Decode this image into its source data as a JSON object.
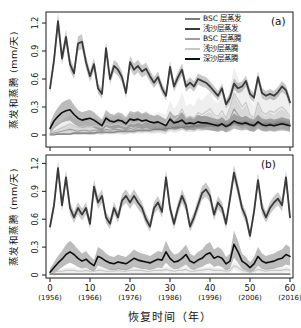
{
  "figure": {
    "background": "#ffffff",
    "frame_color": "#1a1a1a"
  },
  "axes": {
    "ylabel": "蒸发和蒸腾 (mm/天)",
    "xlabel": "恢复时间（年）",
    "y_ticks": [
      "0",
      "0.3",
      "0.6",
      "0.9",
      "1.2"
    ],
    "y_tick_values": [
      0,
      0.3,
      0.6,
      0.9,
      1.2
    ],
    "x_ticks": [
      "0",
      "10",
      "20",
      "30",
      "40",
      "50",
      "60"
    ],
    "x_tick_values": [
      0,
      10,
      20,
      30,
      40,
      50,
      60
    ],
    "x_tick_years": [
      "(1956)",
      "(1966)",
      "(1976)",
      "(1986)",
      "(1996)",
      "(2006)",
      "(2016)"
    ]
  },
  "chart_data": [
    {
      "type": "line",
      "panel_label": "(a)",
      "xlabel": "恢复时间（年）",
      "ylabel": "蒸发和蒸腾 (mm/天)",
      "x_range": [
        0,
        60
      ],
      "y_range": [
        0,
        1.2
      ],
      "grid": false,
      "legend_position": "top-right-inside",
      "x": [
        0,
        1,
        2,
        3,
        4,
        5,
        6,
        7,
        8,
        9,
        10,
        11,
        12,
        13,
        14,
        15,
        16,
        17,
        18,
        19,
        20,
        21,
        22,
        23,
        24,
        25,
        26,
        27,
        28,
        29,
        30,
        31,
        32,
        33,
        34,
        35,
        36,
        37,
        38,
        39,
        40,
        41,
        42,
        43,
        44,
        45,
        46,
        47,
        48,
        49,
        50,
        51,
        52,
        53,
        54,
        55,
        56,
        57,
        58,
        59,
        60
      ],
      "series": [
        {
          "name": "BSC 层蒸发",
          "color": "#7d7d7d",
          "band_abs": 0.012,
          "band_rel": 0.1,
          "values": [
            0.0,
            0.0,
            0.01,
            0.01,
            0.01,
            0.01,
            0.02,
            0.02,
            0.02,
            0.02,
            0.02,
            0.02,
            0.03,
            0.03,
            0.03,
            0.03,
            0.03,
            0.04,
            0.04,
            0.04,
            0.04,
            0.04,
            0.05,
            0.05,
            0.05,
            0.05,
            0.06,
            0.06,
            0.06,
            0.07,
            0.07,
            0.08,
            0.08,
            0.08,
            0.09,
            0.09,
            0.1,
            0.1,
            0.1,
            0.11,
            0.11,
            0.11,
            0.11,
            0.12,
            0.11,
            0.12,
            0.13,
            0.12,
            0.12,
            0.13,
            0.12,
            0.11,
            0.13,
            0.12,
            0.12,
            0.12,
            0.12,
            0.13,
            0.13,
            0.13,
            0.12
          ]
        },
        {
          "name": "浅沙层蒸发",
          "color": "#3a3a3a",
          "band_abs": 0.03,
          "band_rel": 0.05,
          "values": [
            0.5,
            0.8,
            1.22,
            0.82,
            1.05,
            0.76,
            0.66,
            0.98,
            1.0,
            0.78,
            0.63,
            0.76,
            0.5,
            0.44,
            0.93,
            0.6,
            0.74,
            0.7,
            0.62,
            0.45,
            0.78,
            0.7,
            0.74,
            0.68,
            0.71,
            0.63,
            0.56,
            0.62,
            0.5,
            0.42,
            0.73,
            0.52,
            0.62,
            0.7,
            0.52,
            0.56,
            0.52,
            0.6,
            0.58,
            0.56,
            0.52,
            0.47,
            0.42,
            0.5,
            0.33,
            0.4,
            0.55,
            0.5,
            0.52,
            0.58,
            0.44,
            0.4,
            0.62,
            0.45,
            0.42,
            0.44,
            0.42,
            0.46,
            0.52,
            0.48,
            0.35
          ]
        },
        {
          "name": "BSC 层蒸腾",
          "color": "#9e9e9e",
          "band_abs": 0.02,
          "band_rel": 0.5,
          "values": [
            0.01,
            0.02,
            0.03,
            0.04,
            0.05,
            0.06,
            0.05,
            0.04,
            0.05,
            0.05,
            0.04,
            0.05,
            0.05,
            0.04,
            0.06,
            0.05,
            0.06,
            0.06,
            0.05,
            0.05,
            0.07,
            0.06,
            0.08,
            0.07,
            0.08,
            0.07,
            0.07,
            0.08,
            0.07,
            0.06,
            0.12,
            0.09,
            0.11,
            0.15,
            0.1,
            0.11,
            0.1,
            0.13,
            0.12,
            0.14,
            0.15,
            0.12,
            0.11,
            0.14,
            0.1,
            0.17,
            0.28,
            0.22,
            0.17,
            0.2,
            0.12,
            0.1,
            0.2,
            0.14,
            0.12,
            0.15,
            0.13,
            0.16,
            0.17,
            0.15,
            0.11
          ]
        },
        {
          "name": "浅沙层蒸腾",
          "color": "#c6c6c6",
          "band_abs": 0.03,
          "band_rel": 0.55,
          "values": [
            0.02,
            0.04,
            0.06,
            0.08,
            0.1,
            0.12,
            0.1,
            0.08,
            0.09,
            0.1,
            0.08,
            0.1,
            0.09,
            0.08,
            0.12,
            0.1,
            0.11,
            0.12,
            0.1,
            0.09,
            0.13,
            0.12,
            0.14,
            0.12,
            0.15,
            0.13,
            0.12,
            0.14,
            0.13,
            0.12,
            0.22,
            0.16,
            0.2,
            0.28,
            0.18,
            0.2,
            0.18,
            0.24,
            0.22,
            0.25,
            0.28,
            0.22,
            0.2,
            0.26,
            0.18,
            0.3,
            0.45,
            0.38,
            0.3,
            0.35,
            0.22,
            0.18,
            0.35,
            0.25,
            0.22,
            0.26,
            0.24,
            0.28,
            0.3,
            0.26,
            0.2
          ]
        },
        {
          "name": "深沙层蒸腾",
          "color": "#101010",
          "band_abs": 0.035,
          "band_rel": 0.3,
          "values": [
            0.07,
            0.15,
            0.2,
            0.24,
            0.26,
            0.27,
            0.22,
            0.18,
            0.16,
            0.17,
            0.18,
            0.16,
            0.13,
            0.1,
            0.18,
            0.15,
            0.14,
            0.16,
            0.15,
            0.12,
            0.17,
            0.16,
            0.17,
            0.15,
            0.16,
            0.14,
            0.13,
            0.14,
            0.12,
            0.1,
            0.17,
            0.13,
            0.14,
            0.16,
            0.12,
            0.13,
            0.12,
            0.14,
            0.13,
            0.13,
            0.12,
            0.11,
            0.1,
            0.12,
            0.09,
            0.11,
            0.15,
            0.13,
            0.12,
            0.13,
            0.11,
            0.1,
            0.14,
            0.11,
            0.1,
            0.11,
            0.1,
            0.11,
            0.12,
            0.11,
            0.1
          ]
        }
      ]
    },
    {
      "type": "line",
      "panel_label": "(b)",
      "xlabel": "恢复时间（年）",
      "ylabel": "蒸发和蒸腾 (mm/天)",
      "x_range": [
        0,
        60
      ],
      "y_range": [
        0,
        1.2
      ],
      "grid": false,
      "legend_position": "none",
      "x": [
        0,
        1,
        2,
        3,
        4,
        5,
        6,
        7,
        8,
        9,
        10,
        11,
        12,
        13,
        14,
        15,
        16,
        17,
        18,
        19,
        20,
        21,
        22,
        23,
        24,
        25,
        26,
        27,
        28,
        29,
        30,
        31,
        32,
        33,
        34,
        35,
        36,
        37,
        38,
        39,
        40,
        41,
        42,
        43,
        44,
        45,
        46,
        47,
        48,
        49,
        50,
        51,
        52,
        53,
        54,
        55,
        56,
        57,
        58,
        59,
        60
      ],
      "series": [
        {
          "name": "BSC 层蒸发",
          "color": "#7d7d7d",
          "band_abs": 0.004,
          "band_rel": 0.0,
          "values": [
            0.01,
            0.01,
            0.01,
            0.01,
            0.01,
            0.01,
            0.01,
            0.01,
            0.01,
            0.01,
            0.01,
            0.01,
            0.01,
            0.01,
            0.01,
            0.01,
            0.01,
            0.01,
            0.01,
            0.01,
            0.01,
            0.01,
            0.01,
            0.01,
            0.01,
            0.01,
            0.01,
            0.01,
            0.01,
            0.01,
            0.01,
            0.01,
            0.01,
            0.01,
            0.01,
            0.01,
            0.01,
            0.01,
            0.01,
            0.01,
            0.01,
            0.01,
            0.01,
            0.01,
            0.01,
            0.01,
            0.01,
            0.01,
            0.01,
            0.01,
            0.01,
            0.01,
            0.01,
            0.01,
            0.01,
            0.01,
            0.01,
            0.01,
            0.01,
            0.01,
            0.01
          ]
        },
        {
          "name": "浅沙层蒸发",
          "color": "#3a3a3a",
          "band_abs": 0.03,
          "band_rel": 0.05,
          "values": [
            0.52,
            0.75,
            1.15,
            0.75,
            1.05,
            0.72,
            0.62,
            0.72,
            0.65,
            0.72,
            0.55,
            0.95,
            0.78,
            0.85,
            0.62,
            0.55,
            0.72,
            0.62,
            0.8,
            0.85,
            0.78,
            0.85,
            0.78,
            0.72,
            0.6,
            0.52,
            0.72,
            0.78,
            0.68,
            1.05,
            0.72,
            0.55,
            0.72,
            0.85,
            0.75,
            0.52,
            0.62,
            0.75,
            0.88,
            0.92,
            0.85,
            0.65,
            0.78,
            0.72,
            0.55,
            0.82,
            1.1,
            0.92,
            0.72,
            0.62,
            0.42,
            0.68,
            1.02,
            0.72,
            0.62,
            0.72,
            0.78,
            0.82,
            0.75,
            1.05,
            0.62
          ]
        },
        {
          "name": "BSC 层蒸腾",
          "color": "#9e9e9e",
          "band_abs": 0.004,
          "band_rel": 0.0,
          "values": [
            0.01,
            0.01,
            0.01,
            0.01,
            0.01,
            0.01,
            0.01,
            0.01,
            0.01,
            0.01,
            0.01,
            0.01,
            0.01,
            0.01,
            0.01,
            0.01,
            0.01,
            0.01,
            0.01,
            0.01,
            0.01,
            0.01,
            0.01,
            0.01,
            0.01,
            0.01,
            0.01,
            0.01,
            0.01,
            0.01,
            0.01,
            0.01,
            0.01,
            0.01,
            0.01,
            0.01,
            0.01,
            0.01,
            0.01,
            0.01,
            0.01,
            0.01,
            0.01,
            0.01,
            0.01,
            0.01,
            0.01,
            0.01,
            0.01,
            0.01,
            0.01,
            0.01,
            0.01,
            0.01,
            0.01,
            0.01,
            0.01,
            0.01,
            0.01,
            0.01,
            0.01
          ]
        },
        {
          "name": "浅沙层蒸腾",
          "color": "#c6c6c6",
          "band_abs": 0.012,
          "band_rel": 0.3,
          "values": [
            0.02,
            0.03,
            0.04,
            0.04,
            0.05,
            0.05,
            0.05,
            0.04,
            0.04,
            0.05,
            0.04,
            0.04,
            0.05,
            0.05,
            0.04,
            0.04,
            0.04,
            0.05,
            0.04,
            0.04,
            0.05,
            0.05,
            0.05,
            0.05,
            0.04,
            0.04,
            0.05,
            0.05,
            0.05,
            0.06,
            0.05,
            0.04,
            0.05,
            0.05,
            0.06,
            0.04,
            0.04,
            0.05,
            0.05,
            0.06,
            0.06,
            0.05,
            0.05,
            0.05,
            0.04,
            0.05,
            0.1,
            0.08,
            0.05,
            0.04,
            0.03,
            0.04,
            0.06,
            0.05,
            0.04,
            0.05,
            0.05,
            0.05,
            0.05,
            0.06,
            0.05
          ]
        },
        {
          "name": "深沙层蒸腾",
          "color": "#101010",
          "band_abs": 0.03,
          "band_rel": 0.35,
          "values": [
            0.03,
            0.08,
            0.13,
            0.17,
            0.22,
            0.25,
            0.22,
            0.18,
            0.15,
            0.17,
            0.13,
            0.1,
            0.2,
            0.18,
            0.15,
            0.13,
            0.12,
            0.14,
            0.13,
            0.12,
            0.15,
            0.18,
            0.16,
            0.15,
            0.14,
            0.13,
            0.15,
            0.17,
            0.16,
            0.25,
            0.18,
            0.14,
            0.15,
            0.18,
            0.22,
            0.15,
            0.13,
            0.16,
            0.18,
            0.22,
            0.24,
            0.18,
            0.2,
            0.18,
            0.12,
            0.15,
            0.33,
            0.25,
            0.15,
            0.12,
            0.08,
            0.12,
            0.2,
            0.15,
            0.13,
            0.14,
            0.15,
            0.17,
            0.18,
            0.22,
            0.2
          ]
        }
      ]
    }
  ]
}
